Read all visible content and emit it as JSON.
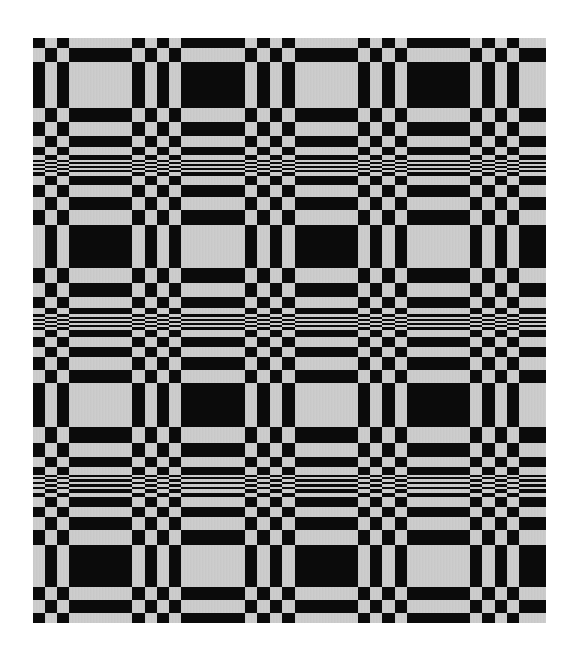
{
  "image": {
    "subject": "woven textile sample with overshot/summer-and-winter style block pattern",
    "colors": {
      "background": "#ffffff",
      "dark": "#0b0b0b",
      "light": "#c9c9c9"
    },
    "fabric_bounds": {
      "left": 33,
      "top": 38,
      "right": 546,
      "bottom": 623
    }
  },
  "weave": {
    "columns": [
      [
        33,
        45,
        0
      ],
      [
        45,
        57,
        1
      ],
      [
        57,
        69,
        0
      ],
      [
        69,
        132,
        1
      ],
      [
        132,
        145,
        0
      ],
      [
        145,
        157,
        1
      ],
      [
        157,
        169,
        0
      ],
      [
        169,
        181,
        1
      ],
      [
        181,
        245,
        0
      ],
      [
        245,
        257,
        1
      ],
      [
        257,
        270,
        0
      ],
      [
        270,
        282,
        1
      ],
      [
        282,
        295,
        0
      ],
      [
        295,
        358,
        1
      ],
      [
        358,
        370,
        0
      ],
      [
        370,
        382,
        1
      ],
      [
        382,
        395,
        0
      ],
      [
        395,
        407,
        1
      ],
      [
        407,
        470,
        0
      ],
      [
        470,
        482,
        1
      ],
      [
        482,
        495,
        0
      ],
      [
        495,
        507,
        1
      ],
      [
        507,
        519,
        0
      ],
      [
        519,
        546,
        1
      ]
    ],
    "rows": [
      [
        38,
        48,
        0
      ],
      [
        48,
        62,
        1
      ],
      [
        62,
        108,
        0
      ],
      [
        108,
        122,
        1
      ],
      [
        122,
        136,
        0
      ],
      [
        136,
        147,
        1
      ],
      [
        147,
        155,
        0
      ],
      [
        155,
        160,
        1
      ],
      [
        160,
        162,
        0
      ],
      [
        162,
        164,
        1
      ],
      [
        164,
        166,
        0
      ],
      [
        166,
        168,
        1
      ],
      [
        168,
        170,
        0
      ],
      [
        170,
        172,
        1
      ],
      [
        172,
        176,
        0
      ],
      [
        176,
        185,
        1
      ],
      [
        185,
        197,
        0
      ],
      [
        197,
        210,
        1
      ],
      [
        210,
        225,
        0
      ],
      [
        225,
        268,
        1
      ],
      [
        268,
        283,
        0
      ],
      [
        283,
        297,
        1
      ],
      [
        297,
        308,
        0
      ],
      [
        308,
        314,
        1
      ],
      [
        314,
        317,
        0
      ],
      [
        317,
        319,
        1
      ],
      [
        319,
        321,
        0
      ],
      [
        321,
        323,
        1
      ],
      [
        323,
        325,
        0
      ],
      [
        325,
        327,
        1
      ],
      [
        327,
        330,
        0
      ],
      [
        330,
        337,
        1
      ],
      [
        337,
        347,
        0
      ],
      [
        347,
        357,
        1
      ],
      [
        357,
        370,
        0
      ],
      [
        370,
        383,
        1
      ],
      [
        383,
        427,
        0
      ],
      [
        427,
        443,
        1
      ],
      [
        443,
        457,
        0
      ],
      [
        457,
        467,
        1
      ],
      [
        467,
        475,
        0
      ],
      [
        475,
        477,
        1
      ],
      [
        477,
        479,
        0
      ],
      [
        479,
        482,
        1
      ],
      [
        482,
        484,
        0
      ],
      [
        484,
        487,
        1
      ],
      [
        487,
        489,
        0
      ],
      [
        489,
        493,
        1
      ],
      [
        493,
        497,
        0
      ],
      [
        497,
        507,
        1
      ],
      [
        507,
        517,
        0
      ],
      [
        517,
        530,
        1
      ],
      [
        530,
        545,
        0
      ],
      [
        545,
        587,
        1
      ],
      [
        587,
        600,
        0
      ],
      [
        600,
        613,
        1
      ],
      [
        613,
        623,
        0
      ]
    ]
  }
}
